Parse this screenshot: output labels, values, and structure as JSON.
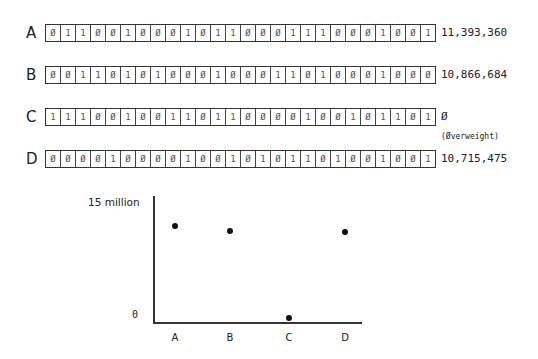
{
  "rows": [
    {
      "label": "A",
      "bits": [
        "0",
        "1",
        "1",
        "0",
        "0",
        "1",
        "0",
        "0",
        "0",
        "1",
        "0",
        "1",
        "1",
        "0",
        "0",
        "0",
        "1",
        "1",
        "1",
        "0",
        "0",
        "0",
        "1",
        "0",
        "0",
        "1"
      ],
      "value": "11,393,360",
      "note": ""
    },
    {
      "label": "B",
      "bits": [
        "0",
        "0",
        "1",
        "1",
        "0",
        "1",
        "0",
        "1",
        "0",
        "0",
        "0",
        "1",
        "0",
        "0",
        "0",
        "1",
        "1",
        "0",
        "1",
        "0",
        "0",
        "0",
        "1",
        "0",
        "0",
        "0"
      ],
      "value": "10,866,684",
      "note": ""
    },
    {
      "label": "C",
      "bits": [
        "1",
        "1",
        "1",
        "0",
        "0",
        "1",
        "0",
        "0",
        "1",
        "1",
        "0",
        "1",
        "1",
        "0",
        "0",
        "0",
        "0",
        "1",
        "0",
        "0",
        "1",
        "0",
        "1",
        "1",
        "0",
        "1"
      ],
      "value": "0",
      "note": "(Overweight)"
    },
    {
      "label": "D",
      "bits": [
        "0",
        "0",
        "0",
        "0",
        "1",
        "0",
        "0",
        "0",
        "0",
        "1",
        "0",
        "0",
        "1",
        "0",
        "1",
        "0",
        "1",
        "1",
        "0",
        "1",
        "0",
        "0",
        "1",
        "0",
        "0",
        "1"
      ],
      "value": "10,715,475",
      "note": ""
    }
  ],
  "chart": {
    "y_top_label": "15 million",
    "y_bottom_label": "0",
    "x_labels": [
      "A",
      "B",
      "C",
      "D"
    ]
  },
  "chart_data": {
    "type": "scatter",
    "title": "",
    "xlabel": "",
    "ylabel": "",
    "categories": [
      "A",
      "B",
      "C",
      "D"
    ],
    "values": [
      11393360,
      10866684,
      0,
      10715475
    ],
    "ylim": [
      0,
      15000000
    ],
    "y_tick_labels": [
      "0",
      "15 million"
    ],
    "grid": false,
    "legend": null
  }
}
